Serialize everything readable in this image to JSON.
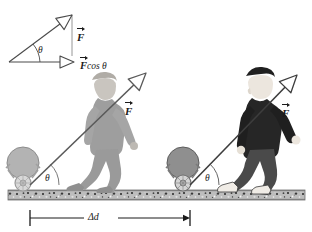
{
  "figure": {
    "type": "physics-diagram",
    "background_color": "#ffffff",
    "ink_color": "#1a1a1a"
  },
  "vector_diagram": {
    "name": "force-component-triangle",
    "force_label": "F",
    "component_label": "F",
    "component_suffix": "cos θ",
    "angle_label": "θ",
    "origin": {
      "x": 8,
      "y": 62
    },
    "force_tip": {
      "x": 78,
      "y": 10
    },
    "component_tip": {
      "x": 72,
      "y": 62
    }
  },
  "scene_left": {
    "name": "initial-position",
    "force_label": "F",
    "angle_label": "θ",
    "figure_style": "faded-ghost",
    "figure_color": "#a8a8a8",
    "cart_color": "#b5b5b5",
    "handle_pivot": {
      "x": 30,
      "y": 185
    },
    "force_tip": {
      "x": 150,
      "y": 70
    }
  },
  "scene_right": {
    "name": "final-position",
    "force_label": "F",
    "angle_label": "θ",
    "figure_style": "solid",
    "shirt_color": "#262626",
    "pants_color": "#4a4a4a",
    "skin_color": "#e8e2da",
    "cart_color": "#8d8d8d",
    "handle_pivot": {
      "x": 190,
      "y": 185
    },
    "force_tip": {
      "x": 300,
      "y": 72
    }
  },
  "ground": {
    "name": "gravel-ground-strip",
    "top_y": 190,
    "height": 10,
    "texture": "speckled-gravel",
    "base_color": "#b9b9b9"
  },
  "displacement": {
    "name": "displacement-measure",
    "label": "Δd",
    "symbol_delta": "Δ",
    "symbol_d": "d",
    "start_x": 30,
    "end_x": 190,
    "y": 218
  }
}
